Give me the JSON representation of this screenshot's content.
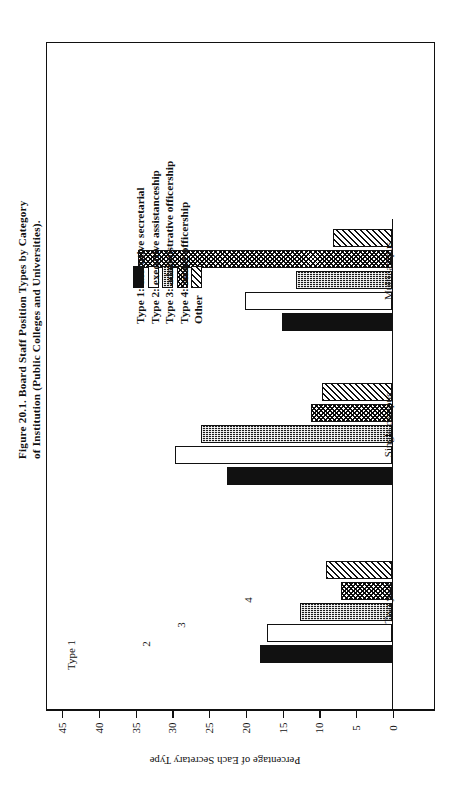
{
  "figure": {
    "caption": "Figure 20.1. Board Staff Position Types by Category\nof Institution (Public Colleges and Universities)."
  },
  "legend": {
    "items": [
      {
        "label": "Type 1: executive secretarial",
        "pattern": "solid-black"
      },
      {
        "label": "Type 2: executive assistanceship",
        "pattern": "open-white"
      },
      {
        "label": "Type 3: administrative officership",
        "pattern": "dense-dots"
      },
      {
        "label": "Type 4: senior officership",
        "pattern": "wavy-crosshatch"
      },
      {
        "label": "Other",
        "pattern": "diagonal-hatch"
      }
    ]
  },
  "annotations": [
    {
      "text": "Type 1"
    },
    {
      "text": "2"
    },
    {
      "text": "3"
    },
    {
      "text": "4"
    }
  ],
  "axis": {
    "value_title": "Percentage of Each Secretary Type",
    "value_ticks": [
      "45",
      "40",
      "35",
      "30",
      "25",
      "20",
      "15",
      "10",
      "5",
      "0"
    ]
  },
  "chart_data": {
    "type": "bar",
    "title": "Figure 20.1. Board Staff Position Types by Category of Institution (Public Colleges and Universities).",
    "orientation": "horizontal",
    "categories": [
      "Two year",
      "Single campus",
      "Multicampus"
    ],
    "series": [
      {
        "name": "Type 1: executive secretarial",
        "values": [
          18.0,
          22.5,
          15.0
        ]
      },
      {
        "name": "Type 2: executive assistanceship",
        "values": [
          17.0,
          29.5,
          20.0
        ]
      },
      {
        "name": "Type 3: administrative officership",
        "values": [
          12.5,
          26.0,
          13.0
        ]
      },
      {
        "name": "Type 4: senior officership",
        "values": [
          7.0,
          11.0,
          34.5
        ]
      },
      {
        "name": "Other",
        "values": [
          9.0,
          9.5,
          8.0
        ]
      }
    ],
    "xlabel": "Percentage of Each Secretary Type",
    "ylabel": "",
    "xlim": [
      0,
      45
    ],
    "xticks": [
      0,
      5,
      10,
      15,
      20,
      25,
      30,
      35,
      40,
      45
    ],
    "grid": false,
    "legend_position": "top-left-inside"
  }
}
